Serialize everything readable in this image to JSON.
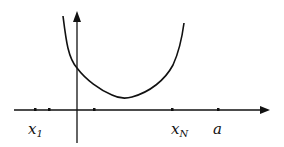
{
  "diagram": {
    "colors": {
      "ink": "#111111",
      "background": "#ffffff"
    },
    "labels": {
      "x1": {
        "base": "x",
        "sub": "1"
      },
      "xN": {
        "base": "x",
        "sub": "N"
      },
      "a": "a"
    },
    "axes": {
      "x_axis": "horizontal axis with arrow",
      "y_axis": "vertical axis with arrow"
    },
    "curve": "convex U-shaped curve crossing the vertical axis, minimum to the right of the axis",
    "tick_count": 5
  }
}
